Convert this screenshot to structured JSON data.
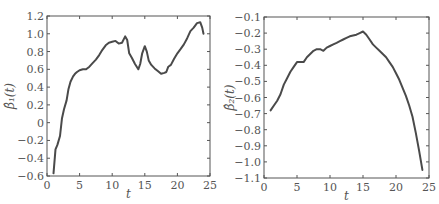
{
  "chart_data": [
    {
      "type": "line",
      "title": "",
      "xlabel": "t",
      "ylabel": "β̂₁(t)",
      "xlim": [
        0,
        25
      ],
      "ylim": [
        -0.6,
        1.2
      ],
      "xticks": [
        0,
        5,
        10,
        15,
        20,
        25
      ],
      "yticks": [
        -0.6,
        -0.4,
        -0.2,
        0,
        0.2,
        0.4,
        0.6,
        0.8,
        1.0,
        1.2
      ],
      "ytick_labels": [
        "−0.6",
        "−0.4",
        "−0.2",
        "0",
        "0.2",
        "0.4",
        "0.6",
        "0.8",
        "1.0",
        "1.2"
      ],
      "xtick_labels": [
        "0",
        "5",
        "10",
        "15",
        "20",
        "25"
      ],
      "grid": false,
      "legend": null,
      "series": [
        {
          "name": "beta1_hat",
          "x": [
            1.0,
            1.3,
            1.6,
            2.0,
            2.3,
            2.6,
            3.0,
            3.3,
            3.6,
            4.0,
            4.3,
            4.6,
            5.0,
            5.5,
            6.0,
            6.5,
            7.0,
            7.5,
            8.0,
            8.5,
            9.0,
            9.5,
            10.0,
            10.5,
            11.0,
            11.5,
            12.0,
            12.3,
            12.6,
            13.0,
            13.5,
            14.0,
            14.3,
            14.6,
            15.0,
            15.3,
            15.6,
            16.0,
            16.5,
            17.0,
            17.5,
            18.0,
            18.3,
            18.6,
            19.0,
            19.5,
            20.0,
            20.5,
            21.0,
            21.5,
            22.0,
            22.5,
            23.0,
            23.5,
            23.8,
            24.0
          ],
          "y": [
            -0.57,
            -0.3,
            -0.25,
            -0.15,
            0.05,
            0.15,
            0.25,
            0.38,
            0.46,
            0.52,
            0.55,
            0.57,
            0.59,
            0.6,
            0.6,
            0.63,
            0.67,
            0.71,
            0.76,
            0.82,
            0.87,
            0.9,
            0.91,
            0.92,
            0.89,
            0.9,
            0.97,
            0.93,
            0.78,
            0.73,
            0.66,
            0.6,
            0.66,
            0.78,
            0.86,
            0.8,
            0.7,
            0.65,
            0.61,
            0.58,
            0.55,
            0.56,
            0.57,
            0.63,
            0.65,
            0.72,
            0.78,
            0.83,
            0.88,
            0.95,
            1.03,
            1.07,
            1.12,
            1.13,
            1.07,
            1.0
          ]
        }
      ]
    },
    {
      "type": "line",
      "title": "",
      "xlabel": "t",
      "ylabel": "β̂₂(t)",
      "xlim": [
        0,
        25
      ],
      "ylim": [
        -1.1,
        -0.1
      ],
      "xticks": [
        0,
        5,
        10,
        15,
        20,
        25
      ],
      "yticks": [
        -1.1,
        -1.0,
        -0.9,
        -0.8,
        -0.7,
        -0.6,
        -0.5,
        -0.4,
        -0.3,
        -0.2,
        -0.1
      ],
      "ytick_labels": [
        "−1.1",
        "−1.0",
        "−0.9",
        "−0.8",
        "−0.7",
        "−0.6",
        "−0.5",
        "−0.4",
        "−0.3",
        "−0.2",
        "−0.1"
      ],
      "xtick_labels": [
        "0",
        "5",
        "10",
        "15",
        "20",
        "25"
      ],
      "grid": false,
      "legend": null,
      "series": [
        {
          "name": "beta2_hat",
          "x": [
            1.0,
            1.5,
            2.0,
            2.5,
            3.0,
            3.5,
            4.0,
            4.5,
            5.0,
            5.5,
            6.0,
            6.5,
            7.0,
            7.5,
            8.0,
            8.5,
            9.0,
            9.5,
            10.0,
            10.5,
            11.0,
            11.5,
            12.0,
            12.5,
            13.0,
            13.5,
            14.0,
            14.5,
            15.0,
            15.5,
            16.0,
            16.5,
            17.0,
            17.5,
            18.0,
            18.5,
            19.0,
            19.5,
            20.0,
            20.5,
            21.0,
            21.5,
            22.0,
            22.5,
            23.0,
            23.5,
            24.0
          ],
          "y": [
            -0.68,
            -0.65,
            -0.62,
            -0.58,
            -0.52,
            -0.48,
            -0.44,
            -0.41,
            -0.38,
            -0.38,
            -0.38,
            -0.35,
            -0.33,
            -0.31,
            -0.3,
            -0.3,
            -0.31,
            -0.29,
            -0.28,
            -0.27,
            -0.26,
            -0.25,
            -0.24,
            -0.23,
            -0.22,
            -0.215,
            -0.21,
            -0.2,
            -0.19,
            -0.21,
            -0.24,
            -0.27,
            -0.29,
            -0.31,
            -0.33,
            -0.35,
            -0.38,
            -0.41,
            -0.45,
            -0.49,
            -0.54,
            -0.59,
            -0.65,
            -0.72,
            -0.82,
            -0.93,
            -1.05
          ]
        }
      ]
    }
  ]
}
